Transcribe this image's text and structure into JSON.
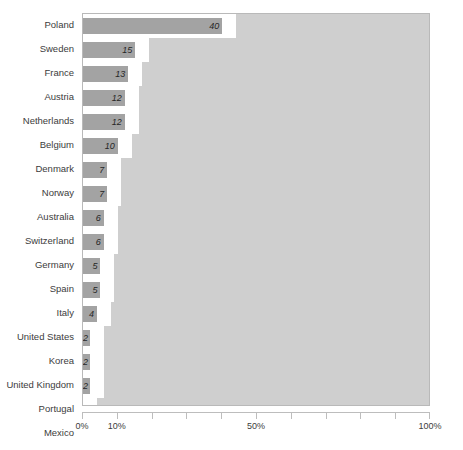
{
  "chart_data": {
    "type": "bar",
    "orientation": "horizontal",
    "title": "",
    "subtitle": "",
    "xlabel": "",
    "ylabel": "",
    "xlim": [
      0,
      100
    ],
    "grid": false,
    "legend": null,
    "value_suffix": "%",
    "categories": [
      "Poland",
      "Sweden",
      "France",
      "Austria",
      "Netherlands",
      "Belgium",
      "Denmark",
      "Norway",
      "Australia",
      "Switzerland",
      "Germany",
      "Spain",
      "Italy",
      "United States",
      "Korea",
      "United Kingdom",
      "Portugal",
      "Mexico"
    ],
    "values": [
      40,
      15,
      13,
      12,
      12,
      10,
      7,
      7,
      6,
      6,
      5,
      5,
      4,
      2,
      2,
      2,
      0,
      0
    ],
    "data_labels": [
      "40",
      "15",
      "13",
      "12",
      "12",
      "10",
      "7",
      "7",
      "6",
      "6",
      "5",
      "5",
      "4",
      "2",
      "2",
      "2",
      "0",
      "0"
    ],
    "axis": {
      "ticks": [
        0,
        10,
        20,
        30,
        40,
        50,
        60,
        70,
        80,
        90,
        100
      ],
      "tick_labels": [
        {
          "value": 0,
          "label": "0%"
        },
        {
          "value": 10,
          "label": "10%"
        },
        {
          "value": 50,
          "label": "50%"
        },
        {
          "value": 100,
          "label": "100%"
        }
      ]
    },
    "colors": {
      "bar": "#a3a3a3",
      "panel_background": "#cfcfcf",
      "cutout": "#ffffff",
      "axis": "#bdbdbd",
      "text": "#3c3c3c"
    }
  }
}
